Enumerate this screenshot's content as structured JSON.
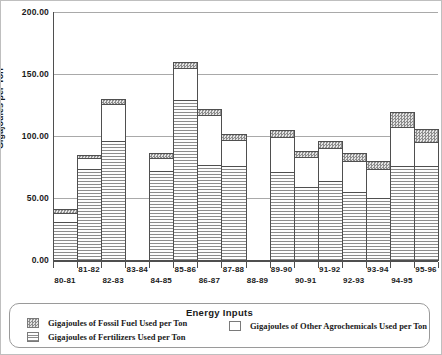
{
  "chart_data": {
    "type": "bar",
    "stacked": true,
    "title": "",
    "xlabel": "Energy Inputs",
    "ylabel": "Gigajoules per Ton",
    "ylim": [
      0,
      200
    ],
    "ytick_step": 50,
    "ytick_labels": [
      "200.00",
      "150.00",
      "100.00",
      "50.00",
      "0.00"
    ],
    "grid": true,
    "legend_position": "bottom",
    "categories": [
      "80-81",
      "81-82",
      "82-83",
      "83-84",
      "84-85",
      "85-86",
      "86-87",
      "87-88",
      "88-89",
      "89-90",
      "90-91",
      "91-92",
      "92-93",
      "93-94",
      "94-95",
      "95-96"
    ],
    "missing_categories": [
      "83-84",
      "88-89"
    ],
    "series": [
      {
        "name": "Gigajoules of Fertilizers Used per Ton",
        "pattern": "horizontal-lines",
        "values": [
          31,
          73,
          96,
          0,
          72,
          129,
          77,
          76,
          0,
          71,
          59,
          64,
          55,
          50,
          76,
          76
        ]
      },
      {
        "name": "Gigajoules of Other Agrochemicals Used per Ton",
        "pattern": "plain-white",
        "values": [
          7,
          9,
          30,
          0,
          10,
          26,
          40,
          21,
          0,
          28,
          24,
          26,
          25,
          23,
          31,
          19
        ]
      },
      {
        "name": "Gigajoules of Fossil Fuel Used per Ton",
        "pattern": "dark-stipple",
        "values": [
          3,
          3,
          4,
          0,
          4,
          5,
          5,
          5,
          0,
          6,
          5,
          6,
          6,
          7,
          12,
          11
        ]
      }
    ],
    "totals": [
      41,
      85,
      130,
      0,
      86,
      160,
      122,
      102,
      0,
      105,
      88,
      96,
      86,
      80,
      119,
      106
    ]
  },
  "legend": {
    "title": "Energy Inputs",
    "entries": [
      {
        "label": "Gigajoules of Fossil Fuel Used per Ton",
        "swatch": "stipple"
      },
      {
        "label": "Gigajoules of Fertilizers Used per Ton",
        "swatch": "lines"
      },
      {
        "label": "Gigajoules of Other Agrochemicals Used per Ton",
        "swatch": "white"
      }
    ]
  },
  "colors": {
    "grid": "#a9a9a9",
    "axis": "#4f4f4f",
    "bar_border": "#4f4f4f",
    "stipple_dark": "#8c8c8c",
    "stipple_light": "#e3e3e3",
    "fertilizer_line": "#8c8c8c",
    "text": "#1a1a1a"
  }
}
